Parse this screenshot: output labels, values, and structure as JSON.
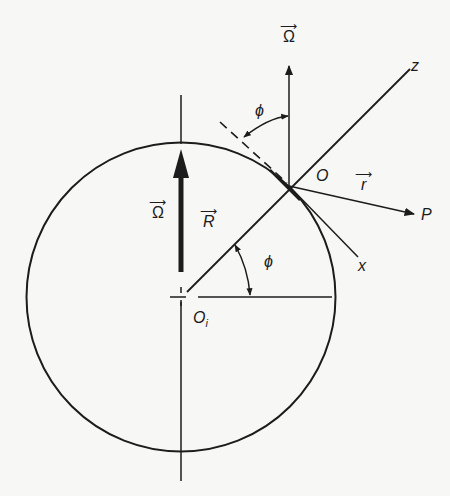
{
  "diagram": {
    "colors": {
      "ink": "#1c1c1c",
      "background": "#f7f7f5"
    },
    "labels": {
      "omega_top": "Ω",
      "omega_center": "Ω",
      "R": "R",
      "r": "r",
      "O": "O",
      "O_i": "O",
      "O_i_sub": "i",
      "P": "P",
      "x": "x",
      "z": "z",
      "phi_top": "ϕ",
      "phi_center": "ϕ",
      "vector_arrow": "⟶"
    },
    "geometry": {
      "circle_center": [
        181,
        297
      ],
      "circle_radius": 154,
      "point_O": [
        289,
        186
      ],
      "point_P": [
        416,
        214
      ],
      "z_end": [
        410,
        69
      ],
      "x_end": [
        358,
        257
      ]
    }
  }
}
